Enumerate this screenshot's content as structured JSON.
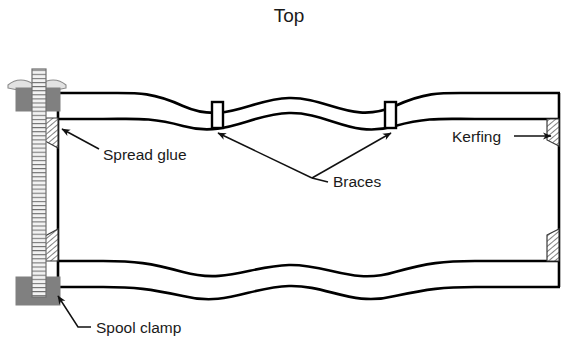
{
  "figure": {
    "title": "Top",
    "background_color": "#ffffff",
    "line_color": "#000000",
    "clamp_block_color": "#808080",
    "wingnut_color": "#d9d9d9",
    "kerfing_hatch_color": "#4d4d4d"
  },
  "labels": {
    "title": "Top",
    "spread_glue": "Spread glue",
    "braces": "Braces",
    "kerfing": "Kerfing",
    "spool_clamp": "Spool clamp"
  },
  "parts": [
    {
      "name": "top",
      "label": "Top",
      "kind": "title"
    },
    {
      "name": "spread-glue",
      "label": "Spread glue",
      "kind": "callout"
    },
    {
      "name": "braces",
      "label": "Braces",
      "kind": "callout",
      "count": 2
    },
    {
      "name": "kerfing",
      "label": "Kerfing",
      "kind": "callout",
      "count": 4
    },
    {
      "name": "spool-clamp",
      "label": "Spool clamp",
      "kind": "callout"
    }
  ]
}
